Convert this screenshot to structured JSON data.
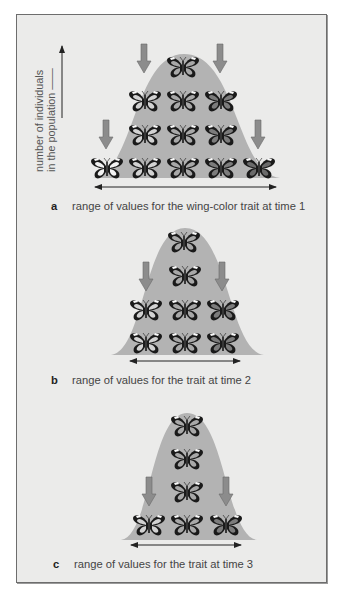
{
  "figure": {
    "y_axis_label": [
      "number of individuals",
      "in the population"
    ],
    "colors": {
      "background": "#ebebea",
      "curve_fill": "#b3b3b3",
      "arrow_fill": "#8c8c8c",
      "butterfly_dark": "#1a1a1a"
    },
    "panels": [
      {
        "letter": "a",
        "caption": "range of values for the wing-color trait at time 1",
        "curve": {
          "x0": 93,
          "x1": 280,
          "peak_x": 184,
          "top": 54,
          "base": 178
        },
        "range_arrow": {
          "x1": 95,
          "x2": 276,
          "y": 187
        },
        "selection_arrows": [
          {
            "x": 144,
            "y": 44
          },
          {
            "x": 220,
            "y": 44
          },
          {
            "x": 106,
            "y": 120
          },
          {
            "x": 258,
            "y": 120
          }
        ],
        "butterflies": [
          {
            "x": 183,
            "y": 67,
            "shade": 3
          },
          {
            "x": 145,
            "y": 101,
            "shade": 2
          },
          {
            "x": 183,
            "y": 101,
            "shade": 3
          },
          {
            "x": 221,
            "y": 101,
            "shade": 4
          },
          {
            "x": 145,
            "y": 135,
            "shade": 2
          },
          {
            "x": 183,
            "y": 135,
            "shade": 3
          },
          {
            "x": 221,
            "y": 135,
            "shade": 4
          },
          {
            "x": 107,
            "y": 168,
            "shade": 1
          },
          {
            "x": 145,
            "y": 168,
            "shade": 2
          },
          {
            "x": 183,
            "y": 168,
            "shade": 3
          },
          {
            "x": 221,
            "y": 168,
            "shade": 4
          },
          {
            "x": 259,
            "y": 168,
            "shade": 5
          }
        ]
      },
      {
        "letter": "b",
        "caption": "range of values for the trait at time 2",
        "curve": {
          "x0": 111,
          "x1": 264,
          "peak_x": 185,
          "top": 228,
          "base": 355
        },
        "range_arrow": {
          "x1": 130,
          "x2": 240,
          "y": 361
        },
        "selection_arrows": [
          {
            "x": 146,
            "y": 262
          },
          {
            "x": 222,
            "y": 262
          }
        ],
        "butterflies": [
          {
            "x": 184,
            "y": 242,
            "shade": 3
          },
          {
            "x": 185,
            "y": 276,
            "shade": 3
          },
          {
            "x": 146,
            "y": 310,
            "shade": 2
          },
          {
            "x": 185,
            "y": 310,
            "shade": 3
          },
          {
            "x": 223,
            "y": 310,
            "shade": 4
          },
          {
            "x": 146,
            "y": 343,
            "shade": 2
          },
          {
            "x": 185,
            "y": 343,
            "shade": 3
          },
          {
            "x": 223,
            "y": 343,
            "shade": 4
          }
        ]
      },
      {
        "letter": "c",
        "caption": "range of values for the trait at time 3",
        "curve": {
          "x0": 121,
          "x1": 257,
          "peak_x": 187,
          "top": 413,
          "base": 540
        },
        "range_arrow": {
          "x1": 131,
          "x2": 241,
          "y": 545
        },
        "selection_arrows": [
          {
            "x": 149,
            "y": 477
          },
          {
            "x": 226,
            "y": 477
          }
        ],
        "butterflies": [
          {
            "x": 187,
            "y": 426,
            "shade": 3
          },
          {
            "x": 187,
            "y": 459,
            "shade": 3
          },
          {
            "x": 187,
            "y": 492,
            "shade": 3
          },
          {
            "x": 149,
            "y": 525,
            "shade": 2
          },
          {
            "x": 187,
            "y": 525,
            "shade": 3
          },
          {
            "x": 226,
            "y": 525,
            "shade": 4
          }
        ]
      }
    ],
    "shade_colors": {
      "1": "#f2f2f2",
      "2": "#d2d2d2",
      "3": "#a8a8a8",
      "4": "#7c7c7c",
      "5": "#6a6a6a"
    }
  }
}
